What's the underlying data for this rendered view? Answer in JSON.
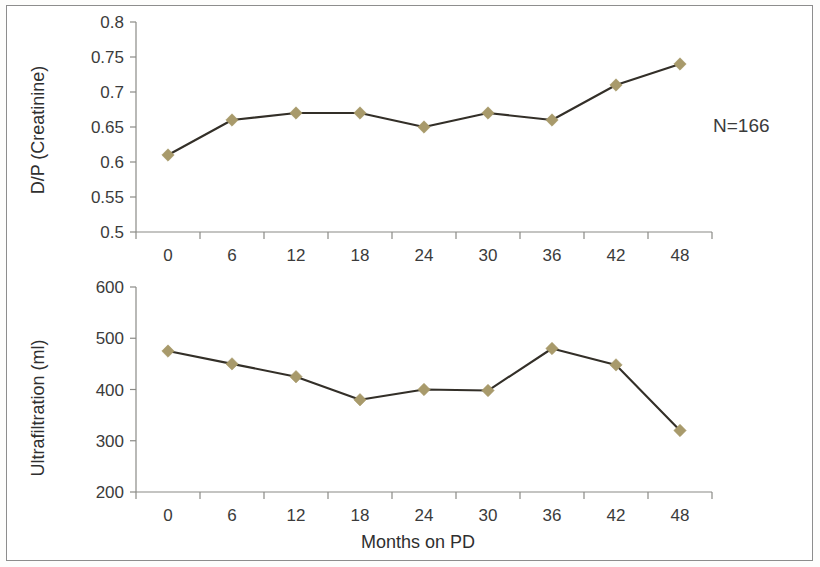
{
  "figure": {
    "background_color": "#ffffff",
    "frame_color": "#8d8d8d",
    "series_line_color": "#332f28",
    "marker_color": "#a89a6b",
    "axis_color": "#8a8a86",
    "text_color": "#3b3b3b"
  },
  "annotations": {
    "sample_size": "N=166"
  },
  "shared": {
    "xlabel": "Months on PD",
    "x_tick_labels": [
      "0",
      "6",
      "12",
      "18",
      "24",
      "30",
      "36",
      "42",
      "48"
    ]
  },
  "panels": {
    "top": {
      "ylabel": "D/P (Creatinine)",
      "y_tick_labels": [
        "0.8",
        "0.75",
        "0.7",
        "0.65",
        "0.6",
        "0.55",
        "0.5"
      ]
    },
    "bottom": {
      "ylabel": "Ultrafiltration (ml)",
      "y_tick_labels": [
        "600",
        "500",
        "400",
        "300",
        "200"
      ]
    }
  },
  "chart_data": [
    {
      "id": "dp_creatinine",
      "type": "line",
      "title": "",
      "xlabel": "",
      "ylabel": "D/P (Creatinine)",
      "x": [
        0,
        6,
        12,
        18,
        24,
        30,
        36,
        42,
        48
      ],
      "x_tick_labels": [
        "0",
        "6",
        "12",
        "18",
        "24",
        "30",
        "36",
        "42",
        "48"
      ],
      "values": [
        0.61,
        0.66,
        0.67,
        0.67,
        0.65,
        0.67,
        0.66,
        0.71,
        0.74
      ],
      "y_ticks": [
        0.5,
        0.55,
        0.6,
        0.65,
        0.7,
        0.75,
        0.8
      ],
      "ylim": [
        0.5,
        0.8
      ],
      "xlim": [
        0,
        48
      ],
      "grid": false,
      "legend": false,
      "marker": "diamond",
      "marker_color": "#a89a6b",
      "line_color": "#332f28",
      "annotations": [
        "N=166"
      ]
    },
    {
      "id": "ultrafiltration",
      "type": "line",
      "title": "",
      "xlabel": "Months on PD",
      "ylabel": "Ultrafiltration (ml)",
      "x": [
        0,
        6,
        12,
        18,
        24,
        30,
        36,
        42,
        48
      ],
      "x_tick_labels": [
        "0",
        "6",
        "12",
        "18",
        "24",
        "30",
        "36",
        "42",
        "48"
      ],
      "values": [
        475,
        450,
        425,
        380,
        400,
        398,
        480,
        448,
        320
      ],
      "y_ticks": [
        200,
        300,
        400,
        500,
        600
      ],
      "ylim": [
        200,
        600
      ],
      "xlim": [
        0,
        48
      ],
      "grid": false,
      "legend": false,
      "marker": "diamond",
      "marker_color": "#a89a6b",
      "line_color": "#332f28"
    }
  ]
}
